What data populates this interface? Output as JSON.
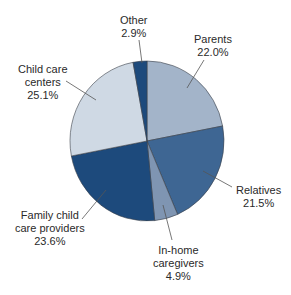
{
  "chart_data": {
    "type": "pie",
    "title": "",
    "categories": [
      "Parents",
      "Relatives",
      "In-home caregivers",
      "Family child care providers",
      "Child care centers",
      "Other"
    ],
    "values": [
      22.0,
      21.5,
      4.9,
      23.6,
      25.1,
      2.9
    ],
    "unit": "%",
    "colors": [
      "#a3b4c9",
      "#3e6693",
      "#7f95b2",
      "#1d4a7c",
      "#cfd9e4",
      "#1d4a7c"
    ],
    "start_angle_deg": 0,
    "direction": "clockwise",
    "legend": "none (direct labels with leader lines)"
  },
  "labels": {
    "other": {
      "name": "Other",
      "value": "2.9%"
    },
    "parents": {
      "name": "Parents",
      "value": "22.0%"
    },
    "relatives": {
      "name": "Relatives",
      "value": "21.5%"
    },
    "inhome": {
      "line1": "In-home",
      "line2": "caregivers",
      "value": "4.9%"
    },
    "family": {
      "line1": "Family child",
      "line2": "care providers",
      "value": "23.6%"
    },
    "centers": {
      "line1": "Child care",
      "line2": "centers",
      "value": "25.1%"
    }
  }
}
